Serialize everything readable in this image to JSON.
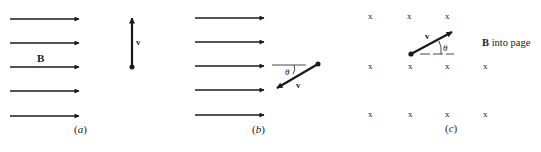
{
  "figure": {
    "panels": [
      {
        "id": "a",
        "caption": "(a)",
        "caption_letter": "a",
        "field_label": "B",
        "field_direction": "right",
        "velocity_label": "v",
        "velocity_direction": "up"
      },
      {
        "id": "b",
        "caption": "(b)",
        "caption_letter": "b",
        "field_direction": "right",
        "velocity_label": "v",
        "angle_label": "θ",
        "velocity_direction": "down-left at angle θ below horizontal"
      },
      {
        "id": "c",
        "caption": "(c)",
        "caption_letter": "c",
        "field_label_bold": "B",
        "field_label_rest": " into page",
        "field_symbol": "x",
        "velocity_label": "v",
        "angle_label": "θ",
        "velocity_direction": "up-right at angle θ above horizontal"
      }
    ],
    "colors": {
      "ink": "#1a1a1a",
      "background": "#ffffff"
    }
  }
}
